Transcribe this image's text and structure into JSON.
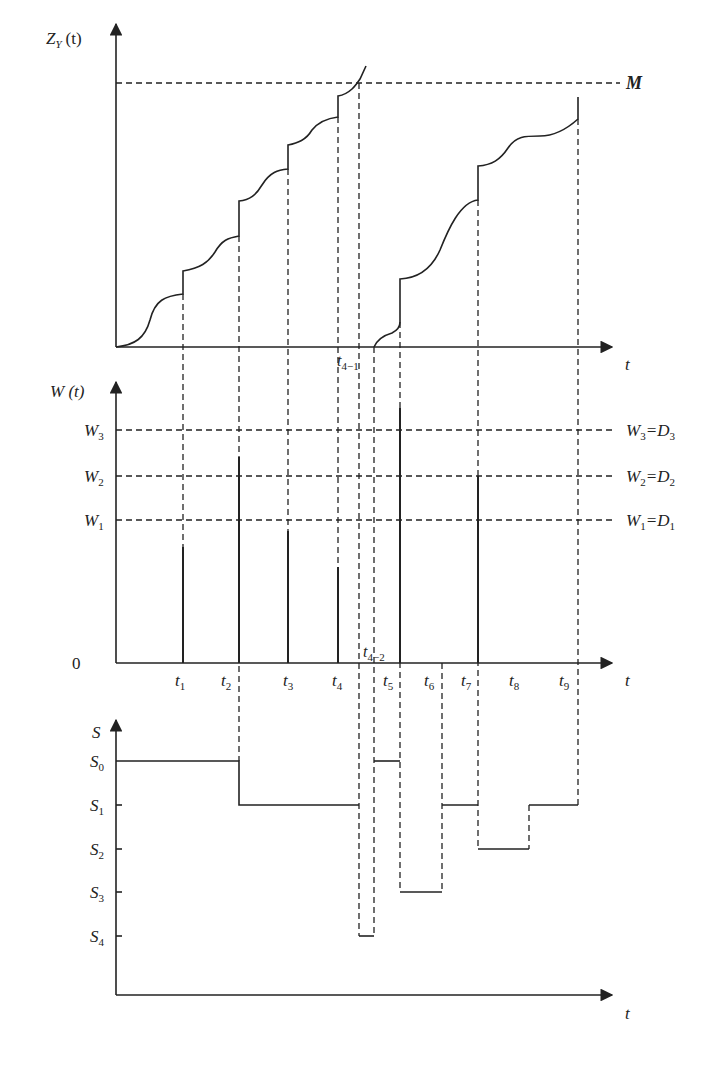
{
  "panels": {
    "top": {
      "y_label_main": "Z",
      "y_label_sub": "Y",
      "y_label_arg": "(t)",
      "x_label": "t",
      "threshold_label": "M",
      "event_label_main": "t",
      "event_label_sub": "4−1"
    },
    "middle": {
      "y_label": "W (t)",
      "zero_label": "0",
      "x_label": "t",
      "levels": [
        {
          "left": "W",
          "sub": "3",
          "right_a": "W",
          "right_a_sub": "3",
          "right_b": "=D",
          "right_b_sub": "3"
        },
        {
          "left": "W",
          "sub": "2",
          "right_a": "W",
          "right_a_sub": "2",
          "right_b": "=D",
          "right_b_sub": "2"
        },
        {
          "left": "W",
          "sub": "1",
          "right_a": "W",
          "right_a_sub": "1",
          "right_b": "=D",
          "right_b_sub": "1"
        }
      ],
      "time_labels": [
        {
          "main": "t",
          "sub": "1"
        },
        {
          "main": "t",
          "sub": "2"
        },
        {
          "main": "t",
          "sub": "3"
        },
        {
          "main": "t",
          "sub": "4"
        },
        {
          "main": "t",
          "sub": "5"
        },
        {
          "main": "t",
          "sub": "6"
        },
        {
          "main": "t",
          "sub": "7"
        },
        {
          "main": "t",
          "sub": "8"
        },
        {
          "main": "t",
          "sub": "9"
        }
      ],
      "extra_label": {
        "main": "t",
        "sub": "4−2"
      }
    },
    "bottom": {
      "y_label": "S",
      "x_label": "t",
      "levels": [
        {
          "main": "S",
          "sub": "0"
        },
        {
          "main": "S",
          "sub": "1"
        },
        {
          "main": "S",
          "sub": "2"
        },
        {
          "main": "S",
          "sub": "3"
        },
        {
          "main": "S",
          "sub": "4"
        }
      ]
    }
  }
}
